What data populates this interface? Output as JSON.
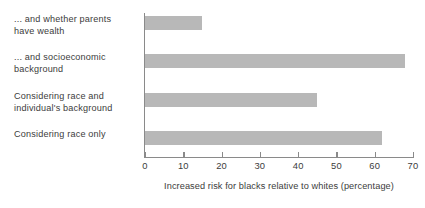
{
  "chart_data": {
    "type": "bar",
    "orientation": "horizontal",
    "title": "",
    "subtitle": "",
    "xlabel": "Increased risk for blacks relative to whites (percentage)",
    "ylabel": "",
    "categories": [
      "Considering race only",
      "Considering race and\nindividual's background",
      "... and socioeconomic\nbackground",
      "... and whether parents\nhave wealth"
    ],
    "values": [
      62,
      45,
      68,
      15
    ],
    "xlim": [
      0,
      70
    ],
    "xticks": [
      0,
      10,
      20,
      30,
      40,
      50,
      60,
      70
    ],
    "xtick_labels": [
      "0",
      "10",
      "20",
      "30",
      "40",
      "50",
      "60",
      "70"
    ],
    "grid": false,
    "legend": false,
    "bar_color": "#b8b8b8",
    "axis_color": "#8a8a8a",
    "text_color": "#3c3c3c",
    "background": "#ffffff"
  }
}
